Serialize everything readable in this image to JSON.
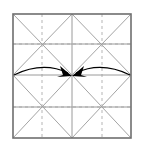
{
  "figure": {
    "type": "crease-pattern-diagram",
    "caption": ""
  },
  "canvas": {
    "width": 141,
    "height": 147,
    "background_color": "#ffffff"
  },
  "square": {
    "name": "paper-square",
    "x": 13,
    "y": 14,
    "width": 118,
    "height": 124,
    "border_color": "#6e6e6e",
    "border_width": 1.6,
    "fill": "#ffffff"
  },
  "grid": {
    "name": "quarter-grid",
    "color": "#9a9a9a",
    "width": 1,
    "vertical_x": [
      42,
      72,
      102
    ],
    "horizontal_y": [
      44,
      75,
      107
    ],
    "major_color": "#8a8a8a"
  },
  "diagonals": {
    "name": "quadrant-diagonals",
    "color": "#8c8c8c",
    "width": 0.8,
    "style": "solid-thin",
    "cells": [
      {
        "x0": 13,
        "y0": 14,
        "x1": 72,
        "y1": 75
      },
      {
        "x0": 72,
        "y0": 14,
        "x1": 131,
        "y1": 75
      },
      {
        "x0": 13,
        "y0": 75,
        "x1": 72,
        "y1": 138
      },
      {
        "x0": 72,
        "y0": 75,
        "x1": 131,
        "y1": 138
      }
    ]
  },
  "dashed_creases": {
    "name": "cell-center-dashed-lines",
    "color": "#b5b5b5",
    "width": 1,
    "dash": "3 3",
    "vertical_x": [
      42,
      102
    ],
    "horizontal_y": [
      44,
      107
    ]
  },
  "arrows": [
    {
      "name": "fold-arrow-left",
      "direction": "right",
      "start_x": 14,
      "start_y": 75,
      "peak_x": 43,
      "peak_y": 65,
      "end_x": 69,
      "end_y": 74,
      "color": "#000000",
      "width": 1.2,
      "head": "solid-triangle"
    },
    {
      "name": "fold-arrow-right",
      "direction": "left",
      "start_x": 130,
      "start_y": 75,
      "peak_x": 101,
      "peak_y": 65,
      "end_x": 75,
      "end_y": 74,
      "color": "#000000",
      "width": 1.2,
      "head": "solid-triangle"
    }
  ],
  "center_point": {
    "name": "center-convergence-point",
    "x": 72,
    "y": 75
  }
}
